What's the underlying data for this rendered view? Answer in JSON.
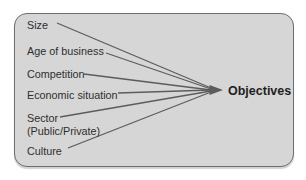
{
  "diagram": {
    "type": "factor-convergence",
    "target": {
      "label": "Objectives"
    },
    "factors": [
      {
        "label": "Size"
      },
      {
        "label": "Age of business"
      },
      {
        "label": "Competition"
      },
      {
        "label": "Economic situation"
      },
      {
        "label": "Sector",
        "sublabel": "(Public/Private)"
      },
      {
        "label": "Culture"
      }
    ],
    "colors": {
      "background": "#ffffff",
      "box_fill": "#d6d6d6",
      "box_border": "#6e6e6e",
      "line": "#5c5c5c",
      "text": "#2e2e2e"
    }
  }
}
